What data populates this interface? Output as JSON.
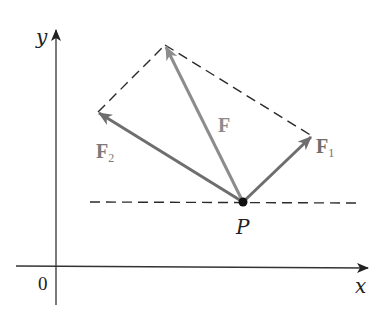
{
  "diagram": {
    "type": "vector-parallelogram",
    "axes": {
      "x_label": "x",
      "y_label": "y",
      "origin_label": "0"
    },
    "point": {
      "label": "P"
    },
    "vectors": [
      {
        "id": "F",
        "label": "F",
        "subscript": "",
        "color": "#8c8c8c"
      },
      {
        "id": "F1",
        "label": "F",
        "subscript": "1",
        "color": "#6e6e6e"
      },
      {
        "id": "F2",
        "label": "F",
        "subscript": "2",
        "color": "#6e6e6e"
      }
    ],
    "colors": {
      "axis": "#333333",
      "dashed": "#2a2a2a",
      "point": "#111111",
      "resultant": "#8c8c8c",
      "component": "#6e6e6e",
      "label_text": "#222222",
      "vector_label": "#7a7a7a"
    }
  }
}
